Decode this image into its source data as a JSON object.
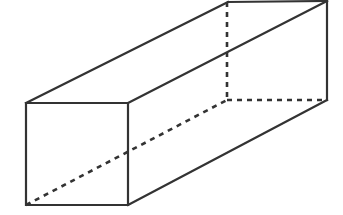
{
  "figure": {
    "type": "geometric-solid-diagram",
    "shape_name": "rectangular prism",
    "background_color": "#ffffff",
    "line_color": "#333333",
    "solid_line_width": 2.2,
    "hidden_line_width": 2.6,
    "hidden_line_dash": "5 5",
    "canvas": {
      "width": 343,
      "height": 215
    },
    "labels": [],
    "vertices": {
      "front_top_left": {
        "x": 26,
        "y": 103
      },
      "front_top_right": {
        "x": 128,
        "y": 103
      },
      "front_bottom_right": {
        "x": 128,
        "y": 205
      },
      "front_bottom_left": {
        "x": 26,
        "y": 205
      },
      "back_top_left": {
        "x": 228,
        "y": 2
      },
      "back_top_right": {
        "x": 327,
        "y": 1
      },
      "back_bottom_right": {
        "x": 327,
        "y": 100
      },
      "back_bottom_left": {
        "x": 227,
        "y": 100
      }
    },
    "edges_solid": [
      {
        "name": "front-face-top",
        "points": "26,103 128,103"
      },
      {
        "name": "front-face-right",
        "points": "128,103 128,205"
      },
      {
        "name": "front-face-bottom",
        "points": "128,205 26,205"
      },
      {
        "name": "front-face-left",
        "points": "26,205 26,103"
      },
      {
        "name": "top-left-lateral",
        "points": "26,103 228,2"
      },
      {
        "name": "top-right-lateral",
        "points": "128,103 327,1"
      },
      {
        "name": "bottom-right-lateral",
        "points": "128,205 327,100"
      },
      {
        "name": "back-face-top",
        "points": "228,2 327,1"
      },
      {
        "name": "back-face-right",
        "points": "327,1 327,100"
      }
    ],
    "edges_hidden": [
      {
        "name": "back-left-vertical",
        "points": "227,2 227,100"
      },
      {
        "name": "bottom-left-lateral",
        "points": "26,205 227,100"
      },
      {
        "name": "back-face-bottom",
        "points": "227,100 327,100"
      }
    ]
  }
}
